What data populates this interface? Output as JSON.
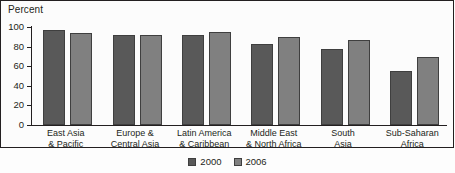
{
  "chart_data": {
    "type": "bar",
    "title": "",
    "ylabel": "Percent",
    "xlabel": "",
    "ylim": [
      0,
      100
    ],
    "yticks": [
      0,
      20,
      40,
      60,
      80,
      100
    ],
    "grid": false,
    "legend_position": "bottom-center",
    "categories": [
      "East Asia\n& Pacific",
      "Europe &\nCentral Asia",
      "Latin America\n& Caribbean",
      "Middle East\n& North Africa",
      "South\nAsia",
      "Sub-Saharan\nAfrica"
    ],
    "category_lines": [
      [
        "East Asia",
        "& Pacific"
      ],
      [
        "Europe &",
        "Central Asia"
      ],
      [
        "Latin America",
        "& Caribbean"
      ],
      [
        "Middle East",
        "& North Africa"
      ],
      [
        "South",
        "Asia"
      ],
      [
        "Sub-Saharan",
        "Africa"
      ]
    ],
    "series": [
      {
        "name": "2000",
        "color": "#595959",
        "values": [
          97,
          92,
          92,
          83,
          78,
          55
        ]
      },
      {
        "name": "2006",
        "color": "#808080",
        "values": [
          94,
          92,
          95,
          90,
          87,
          69
        ]
      }
    ]
  },
  "legend": {
    "items": [
      {
        "label": "2000",
        "color": "#595959"
      },
      {
        "label": "2006",
        "color": "#808080"
      }
    ]
  }
}
